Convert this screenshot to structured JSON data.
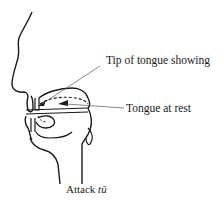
{
  "diagram": {
    "labels": {
      "tip_of_tongue": "Tip of tongue showing",
      "tongue_at_rest": "Tongue at rest"
    },
    "caption": {
      "prefix": "Attack ",
      "syllable": "tū"
    },
    "colors": {
      "line": "#1a1a1a",
      "leader": "#555555",
      "background": "#ffffff"
    }
  }
}
